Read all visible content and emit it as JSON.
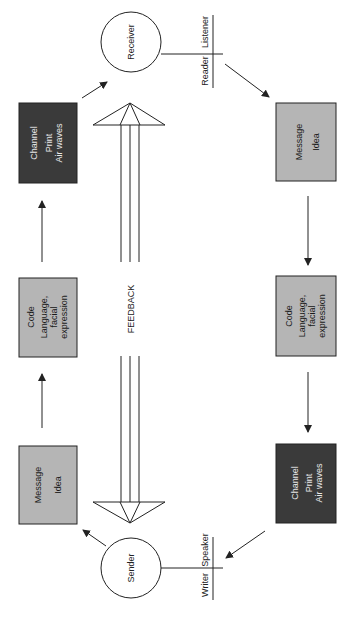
{
  "diagram": {
    "title": "",
    "colors": {
      "background": "#ffffff",
      "light_box": "#b5b5b5",
      "dark_box": "#3a3a3a",
      "stroke": "#222222"
    },
    "nodes": {
      "receiver": {
        "label": "Receiver"
      },
      "sender": {
        "label": "Sender"
      },
      "receiver_roles": {
        "left": "Reader",
        "right": "Listener"
      },
      "sender_roles": {
        "left": "Writer",
        "right": "Speaker"
      }
    },
    "sender_side": {
      "message": {
        "title": "Message",
        "detail": "Idea"
      },
      "code": {
        "title": "Code",
        "detail_1": "Language,",
        "detail_2": "facial",
        "detail_3": "expression"
      },
      "channel": {
        "title": "Channel",
        "detail_1": "Print",
        "detail_2": "Air waves"
      }
    },
    "receiver_side": {
      "message": {
        "title": "Message",
        "detail": "Idea"
      },
      "code": {
        "title": "Code",
        "detail_1": "Language,",
        "detail_2": "facial",
        "detail_3": "expression"
      },
      "channel": {
        "title": "Channel",
        "detail_1": "Print",
        "detail_2": "Air waves"
      }
    },
    "feedback": {
      "label": "FEEDBACK"
    }
  }
}
